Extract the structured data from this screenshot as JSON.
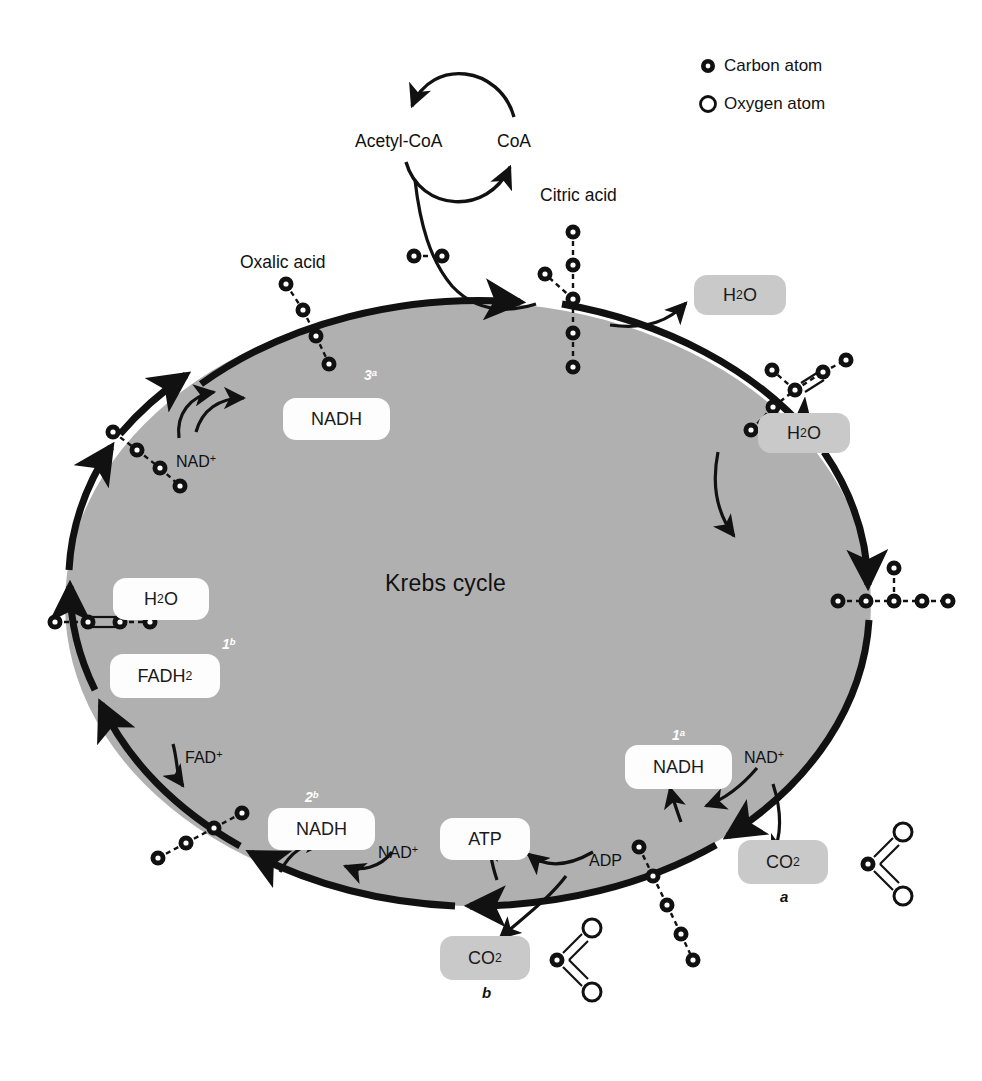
{
  "diagram": {
    "title": "Krebs cycle",
    "legend": [
      {
        "icon": "carbon-atom-icon",
        "label": "Carbon atom",
        "type": "carbon"
      },
      {
        "icon": "oxygen-atom-icon",
        "label": "Oxygen atom",
        "type": "oxygen"
      }
    ],
    "colors": {
      "cycle_fill": "#b0b0b0",
      "chip_white": "#fdfdfd",
      "chip_gray": "#c9c9c9",
      "stroke": "#111111",
      "text": "#111111",
      "step_label": "#ffffff"
    }
  },
  "top_cofactors": {
    "acetyl_coa": "Acetyl-CoA",
    "coa": "CoA"
  },
  "molecule_labels": {
    "citric_acid": "Citric acid",
    "oxalic_acid": "Oxalic acid"
  },
  "chips": [
    {
      "name": "chip-h2o-top-right",
      "text": "H2O",
      "html": "H<sub>2</sub>O",
      "style": "gray"
    },
    {
      "name": "chip-h2o-right",
      "text": "H2O",
      "html": "H<sub>2</sub>O",
      "style": "gray"
    },
    {
      "name": "chip-nadh-upper-left",
      "text": "NADH",
      "html": "NADH",
      "style": "white"
    },
    {
      "name": "chip-h2o-left",
      "text": "H2O",
      "html": "H<sub>2</sub>O",
      "style": "white"
    },
    {
      "name": "chip-fadh2-left",
      "text": "FADH2",
      "html": "FADH<sub>2</sub>",
      "style": "white"
    },
    {
      "name": "chip-nadh-lower-left",
      "text": "NADH",
      "html": "NADH",
      "style": "white"
    },
    {
      "name": "chip-atp",
      "text": "ATP",
      "html": "ATP",
      "style": "white"
    },
    {
      "name": "chip-nadh-right",
      "text": "NADH",
      "html": "NADH",
      "style": "white"
    },
    {
      "name": "chip-co2-right",
      "text": "CO2",
      "html": "CO<sub>2</sub>",
      "style": "gray"
    },
    {
      "name": "chip-co2-bottom",
      "text": "CO2",
      "html": "CO<sub>2</sub>",
      "style": "gray"
    }
  ],
  "cofactor_labels": [
    {
      "name": "nad-plus-upper-left",
      "text": "NAD+",
      "html": "NAD<sup>+</sup>"
    },
    {
      "name": "fad-plus-left",
      "text": "FAD+",
      "html": "FAD<sup>+</sup>"
    },
    {
      "name": "nad-plus-lower-left",
      "text": "NAD+",
      "html": "NAD<sup>+</sup>"
    },
    {
      "name": "adp-bottom",
      "text": "ADP",
      "html": "ADP"
    },
    {
      "name": "nad-plus-right",
      "text": "NAD+",
      "html": "NAD<sup>+</sup>"
    }
  ],
  "step_markers": [
    {
      "name": "step-marker-3a",
      "text": "3a",
      "html": "3<sup>a</sup>"
    },
    {
      "name": "step-marker-1b",
      "text": "1b",
      "html": "1<sup>b</sup>"
    },
    {
      "name": "step-marker-2b",
      "text": "2b",
      "html": "2<sup>b</sup>"
    },
    {
      "name": "step-marker-1a",
      "text": "1a",
      "html": "1<sup>a</sup>"
    }
  ],
  "footnotes": [
    {
      "name": "footnote-a",
      "text": "a"
    },
    {
      "name": "footnote-b",
      "text": "b"
    }
  ],
  "chart_data": {
    "type": "diagram",
    "title": "Krebs cycle",
    "molecules": [
      {
        "name": "acetyl-group",
        "carbons": 2,
        "position": "top-center",
        "layout": "horizontal-pair"
      },
      {
        "name": "citric-acid",
        "carbons": 6,
        "position": "top",
        "layout": "vertical-chain-with-left-branch"
      },
      {
        "name": "isocitrate-6c",
        "carbons": 6,
        "position": "upper-right",
        "layout": "branched-with-double-bond"
      },
      {
        "name": "alpha-ketoglutarate-5c",
        "carbons": 5,
        "position": "right",
        "layout": "horizontal-chain-with-up-branch"
      },
      {
        "name": "succinyl-4c",
        "carbons": 5,
        "position": "lower-right",
        "layout": "diagonal-chain"
      },
      {
        "name": "succinic-acid-4c",
        "carbons": 4,
        "position": "bottom-left",
        "layout": "diagonal-chain"
      },
      {
        "name": "fumaric-acid-4c",
        "carbons": 4,
        "position": "left",
        "layout": "horizontal-chain-double-bond"
      },
      {
        "name": "malic-acid-4c",
        "carbons": 4,
        "position": "upper-left",
        "layout": "diagonal-chain"
      },
      {
        "name": "oxalic-acid-4c",
        "carbons": 4,
        "position": "top-left",
        "layout": "diagonal-chain"
      },
      {
        "name": "carbon-dioxide-a",
        "carbons": 1,
        "oxygens": 2,
        "position": "right",
        "layout": "co2-double-bonds"
      },
      {
        "name": "carbon-dioxide-b",
        "carbons": 1,
        "oxygens": 2,
        "position": "bottom",
        "layout": "co2-double-bonds"
      }
    ],
    "outputs": [
      "NADH",
      "NADH",
      "NADH",
      "FADH2",
      "ATP",
      "CO2",
      "CO2",
      "H2O",
      "H2O"
    ],
    "inputs": [
      "Acetyl-CoA",
      "NAD+",
      "NAD+",
      "NAD+",
      "FAD+",
      "ADP",
      "H2O"
    ]
  }
}
